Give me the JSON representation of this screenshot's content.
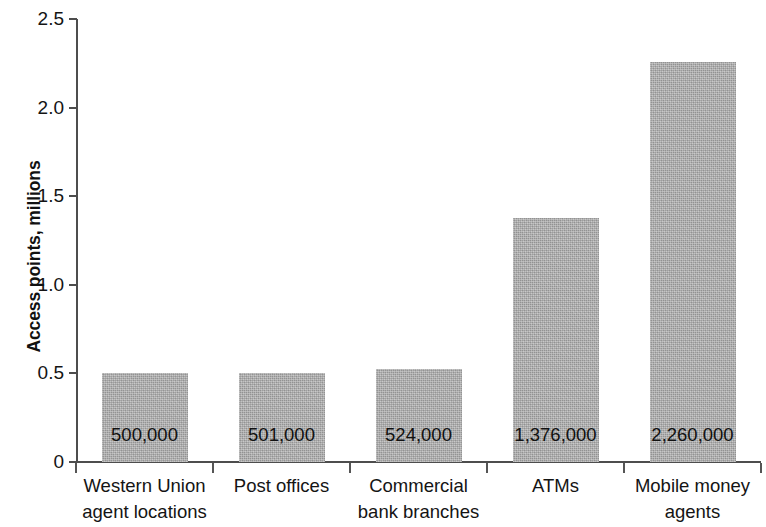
{
  "chart_data": {
    "type": "bar",
    "title": "",
    "subtitle": "",
    "xlabel": "",
    "ylabel": "Access points, millions",
    "ylim": [
      0,
      2.5
    ],
    "xlim": null,
    "grid": false,
    "legend": null,
    "legend_position": "none",
    "bar_color": "#ababab",
    "axis_color": "#4d4d4d",
    "text_color": "#141414",
    "categories": [
      "Western Union agent locations",
      "Post offices",
      "Commercial bank branches",
      "ATMs",
      "Mobile money agents"
    ],
    "category_lines": [
      [
        "Western Union",
        "agent locations"
      ],
      [
        "Post offices"
      ],
      [
        "Commercial",
        "bank branches"
      ],
      [
        "ATMs"
      ],
      [
        "Mobile money",
        "agents"
      ]
    ],
    "values": [
      0.5,
      0.501,
      0.524,
      1.376,
      2.26
    ],
    "data_labels": [
      "500,000",
      "501,000",
      "524,000",
      "1,376,000",
      "2,260,000"
    ],
    "yticks": [
      0,
      0.5,
      1.0,
      1.5,
      2.0,
      2.5
    ],
    "ytick_labels": [
      "0",
      "0.5",
      "1.0",
      "1.5",
      "2.0",
      "2.5"
    ]
  },
  "axis": {
    "y_title": "Access points, millions"
  }
}
